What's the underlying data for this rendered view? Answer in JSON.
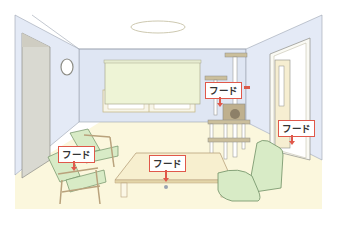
{
  "scene": {
    "title": "Living room illustration with detector placement",
    "colors": {
      "wall": "#dfe6f3",
      "wall_side": "#e4eaf6",
      "floor": "#fbf7dd",
      "ceiling": "#ffffff",
      "blind": "#eef4d6",
      "furniture_green": "#d8ebc6",
      "wood": "#d9c9a2",
      "table_top": "#f7efcf",
      "label_border": "#e0584a",
      "line": "#8d8d86"
    }
  },
  "labels": [
    {
      "id": "cat-tower",
      "text": "フード",
      "x": 205,
      "y": 82
    },
    {
      "id": "door-right",
      "text": "フード",
      "x": 278,
      "y": 120
    },
    {
      "id": "armchair",
      "text": "フード",
      "x": 58,
      "y": 146
    },
    {
      "id": "table",
      "text": "フード",
      "x": 149,
      "y": 155
    }
  ]
}
